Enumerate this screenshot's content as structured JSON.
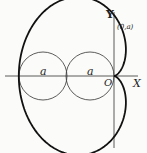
{
  "diagram": {
    "type": "cardioid",
    "labels": {
      "y_axis": "Y",
      "x_axis": "X",
      "origin": "O",
      "point": "(0,a)",
      "left_radius": "a",
      "right_radius": "a"
    },
    "geometry": {
      "origin": [
        114,
        76
      ],
      "a_px": 24,
      "circles": [
        {
          "cx": 43,
          "cy": 76,
          "r": 24
        },
        {
          "cx": 90,
          "cy": 76,
          "r": 24
        }
      ]
    },
    "colors": {
      "curve": "#111111",
      "thin": "#333333"
    }
  }
}
